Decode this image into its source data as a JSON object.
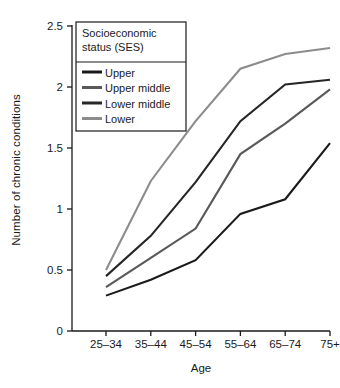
{
  "chart_data": {
    "type": "line",
    "title": "",
    "xlabel": "Age",
    "ylabel": "Number of chronic conditions",
    "categories": [
      "25–34",
      "35–44",
      "45–54",
      "55–64",
      "65–74",
      "75+"
    ],
    "ylim": [
      0,
      2.5
    ],
    "yticks": [
      0,
      0.5,
      1,
      1.5,
      2,
      2.5
    ],
    "ytick_labels": [
      "0",
      "0.5",
      "1",
      "1.5",
      "2",
      "2.5"
    ],
    "grid": false,
    "legend_position": "upper left",
    "legend_title_lines": [
      "Socioeconomic",
      "status (SES)"
    ],
    "series": [
      {
        "name": "Upper",
        "color": "#1a1a1a",
        "values": [
          0.29,
          0.42,
          0.58,
          0.96,
          1.08,
          1.54
        ]
      },
      {
        "name": "Upper middle",
        "color": "#595959",
        "values": [
          0.36,
          0.6,
          0.84,
          1.45,
          1.7,
          1.98
        ]
      },
      {
        "name": "Lower middle",
        "color": "#262626",
        "values": [
          0.45,
          0.78,
          1.22,
          1.72,
          2.02,
          2.06
        ]
      },
      {
        "name": "Lower",
        "color": "#8c8c8c",
        "values": [
          0.5,
          1.23,
          1.72,
          2.15,
          2.27,
          2.32
        ]
      }
    ]
  },
  "axis": {
    "y_title": "Number of chronic conditions",
    "x_title": "Age"
  }
}
